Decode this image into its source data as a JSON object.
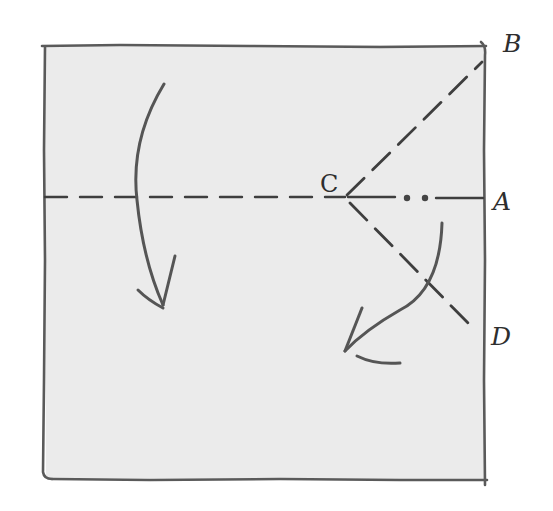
{
  "diagram": {
    "type": "origami-fold-instruction",
    "colors": {
      "paper": "#ebebeb",
      "edge": "#5a5a5a",
      "crease": "#3e3e3e",
      "arrow": "#555555",
      "label": "#2e2e2e"
    },
    "paper": {
      "shape": "square",
      "corners": [
        [
          44,
          46
        ],
        [
          485,
          46
        ],
        [
          485,
          480
        ],
        [
          44,
          478
        ]
      ]
    },
    "points": {
      "A": {
        "label": "A",
        "x": 485,
        "y": 197
      },
      "B": {
        "label": "B",
        "x": 483,
        "y": 58
      },
      "C": {
        "label": "C",
        "x": 345,
        "y": 197
      },
      "D": {
        "label": "D",
        "x": 483,
        "y": 340
      }
    },
    "creases": [
      {
        "name": "horizontal-midline",
        "from": "left-edge",
        "to": "A",
        "style": "dashed"
      },
      {
        "name": "fold-line-CB",
        "from": "C",
        "to": "B",
        "style": "dashed"
      },
      {
        "name": "fold-line-CD",
        "from": "C",
        "to": "D",
        "style": "dashed"
      }
    ],
    "annotations": {
      "dots_between_C_and_A": 2
    },
    "arrows": [
      {
        "name": "fold-top-half-down",
        "direction": "down"
      },
      {
        "name": "fold-corner-down-left",
        "direction": "down-left"
      }
    ]
  }
}
